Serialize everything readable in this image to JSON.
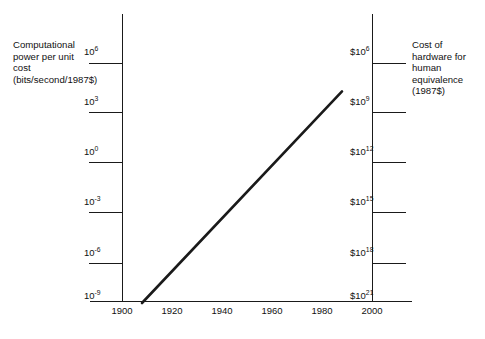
{
  "captions": {
    "left": "Computational power per unit cost (bits/second/1987$)",
    "right": "Cost of hardware for human equivalence (1987$)"
  },
  "chart_data": {
    "type": "line",
    "title": "",
    "xlabel": "",
    "ylabel": "Computational power per unit cost (bits/second/1987$)",
    "ylabel_right": "Cost of hardware for human equivalence (1987$)",
    "grid": false,
    "legend": "none",
    "xlim": [
      1895,
      2005
    ],
    "x_ticks": [
      "1900",
      "1920",
      "1940",
      "1960",
      "1980",
      "2000"
    ],
    "x_tick_values": [
      1900,
      1920,
      1940,
      1960,
      1980,
      2000
    ],
    "y_left_ticks": [
      {
        "mantissa": "10",
        "exponent": "6",
        "text": "10^6"
      },
      {
        "mantissa": "10",
        "exponent": "3",
        "text": "10^3"
      },
      {
        "mantissa": "10",
        "exponent": "0",
        "text": "10^0"
      },
      {
        "mantissa": "10",
        "exponent": "-3",
        "text": "10^-3"
      },
      {
        "mantissa": "10",
        "exponent": "-6",
        "text": "10^-6"
      },
      {
        "mantissa": "10",
        "exponent": "-9",
        "text": "10^-9"
      }
    ],
    "y_right_ticks": [
      {
        "mantissa": "$10",
        "exponent": "6",
        "text": "$10^6"
      },
      {
        "mantissa": "$10",
        "exponent": "9",
        "text": "$10^9"
      },
      {
        "mantissa": "$10",
        "exponent": "12",
        "text": "$10^12"
      },
      {
        "mantissa": "$10",
        "exponent": "15",
        "text": "$10^15"
      },
      {
        "mantissa": "$10",
        "exponent": "18",
        "text": "$10^18"
      },
      {
        "mantissa": "$10",
        "exponent": "21",
        "text": "$10^21"
      }
    ],
    "ylim_left_log10": [
      -9,
      6
    ],
    "ylim_right_log10": [
      21,
      6
    ],
    "series": [
      {
        "name": "computational power per unit cost",
        "x": [
          1908,
          1988
        ],
        "y_log10": [
          -8.4,
          4.3
        ]
      }
    ],
    "line_color": "#1a1a1a",
    "line_width": 2.6
  }
}
